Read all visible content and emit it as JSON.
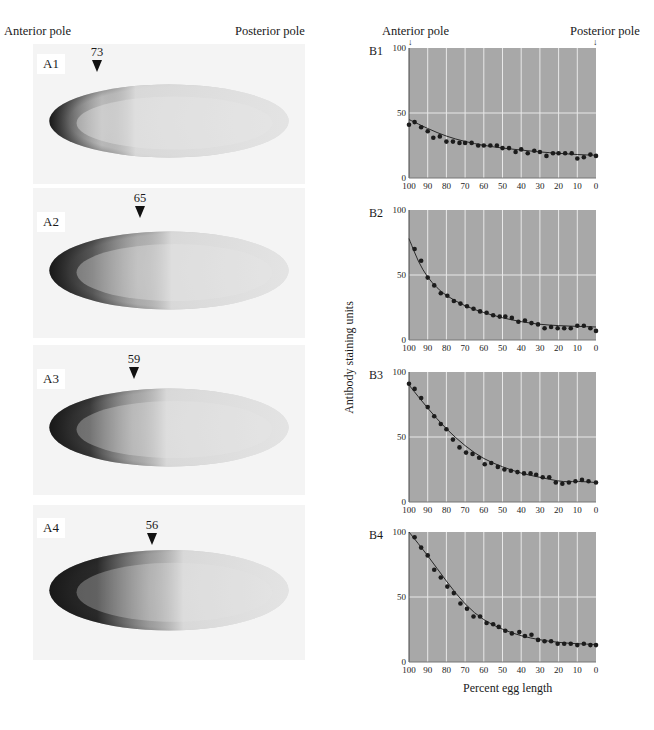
{
  "left_panel": {
    "anterior_label": "Anterior pole",
    "posterior_label": "Posterior pole",
    "photos": [
      {
        "tag": "A1",
        "marker": "73",
        "marker_x": 97,
        "top": 44,
        "height": 140,
        "stain": 0.55
      },
      {
        "tag": "A2",
        "marker": "65",
        "marker_x": 140,
        "top": 188,
        "height": 150,
        "stain": 0.75
      },
      {
        "tag": "A3",
        "marker": "59",
        "marker_x": 134,
        "top": 345,
        "height": 150,
        "stain": 0.9
      },
      {
        "tag": "A4",
        "marker": "56",
        "marker_x": 152,
        "top": 505,
        "height": 155,
        "stain": 1.0
      }
    ]
  },
  "right_panel": {
    "anterior_label": "Anterior pole",
    "posterior_label": "Posterior pole",
    "ylabel": "Antibody staining units",
    "xlabel": "Percent egg length"
  },
  "colors": {
    "plot_bg": "#a8a8a8",
    "grid": "#e8e8e8",
    "points": "#1c1c1c",
    "curve": "#2a2a2a"
  },
  "chart_data": [
    {
      "type": "scatter",
      "title": "B1",
      "xlabel": "Percent egg length",
      "ylabel": "Antibody staining units",
      "xlim": [
        100,
        0
      ],
      "ylim": [
        0,
        100
      ],
      "xticks": [
        100,
        90,
        80,
        70,
        60,
        50,
        40,
        30,
        20,
        10,
        0
      ],
      "yticks": [
        0,
        50,
        100
      ],
      "grid": true,
      "x": [
        100,
        97,
        93.5,
        90,
        87,
        83.5,
        80,
        76.5,
        73,
        70,
        66.5,
        63,
        60,
        56.5,
        53,
        50,
        46.5,
        43,
        40,
        36.5,
        33,
        30,
        26.5,
        23,
        20,
        16.5,
        13,
        10,
        6.5,
        3,
        0
      ],
      "values": [
        41,
        43,
        39,
        36,
        31,
        32,
        28,
        28,
        27,
        27,
        27,
        25,
        25,
        25,
        25,
        23,
        23,
        20,
        22,
        19,
        21,
        20,
        17,
        19,
        19,
        19,
        19,
        15,
        16,
        18,
        17
      ],
      "fit": [
        [
          100,
          45
        ],
        [
          90,
          38
        ],
        [
          80,
          32
        ],
        [
          70,
          28
        ],
        [
          60,
          25
        ],
        [
          50,
          23
        ],
        [
          40,
          21.5
        ],
        [
          30,
          20
        ],
        [
          20,
          19
        ],
        [
          10,
          18
        ],
        [
          0,
          17.5
        ]
      ]
    },
    {
      "type": "scatter",
      "title": "B2",
      "xlabel": "Percent egg length",
      "ylabel": "Antibody staining units",
      "xlim": [
        100,
        0
      ],
      "ylim": [
        0,
        100
      ],
      "xticks": [
        100,
        90,
        80,
        70,
        60,
        50,
        40,
        30,
        20,
        10,
        0
      ],
      "yticks": [
        0,
        50,
        100
      ],
      "grid": true,
      "x": [
        97,
        93.5,
        90,
        86.5,
        83,
        79.5,
        76,
        72.5,
        69,
        65.5,
        62,
        58.5,
        55,
        51.5,
        48.5,
        45,
        41.5,
        38,
        34.5,
        31,
        27.5,
        24,
        20.5,
        17,
        13.5,
        10,
        6.5,
        3,
        0
      ],
      "values": [
        70,
        61,
        48,
        42,
        36,
        34,
        30,
        28,
        26,
        24,
        22,
        21,
        19,
        18,
        18,
        17,
        14,
        15,
        13,
        12,
        9,
        10,
        9,
        9,
        9,
        11,
        11,
        9,
        7
      ],
      "fit": [
        [
          100,
          78
        ],
        [
          95,
          60
        ],
        [
          90,
          48
        ],
        [
          85,
          40
        ],
        [
          80,
          34
        ],
        [
          70,
          26
        ],
        [
          60,
          21
        ],
        [
          50,
          17
        ],
        [
          40,
          14
        ],
        [
          30,
          12
        ],
        [
          20,
          11
        ],
        [
          10,
          10.5
        ],
        [
          0,
          10
        ]
      ]
    },
    {
      "type": "scatter",
      "title": "B3",
      "xlabel": "Percent egg length",
      "ylabel": "Antibody staining units",
      "xlim": [
        100,
        0
      ],
      "ylim": [
        0,
        100
      ],
      "xticks": [
        100,
        90,
        80,
        70,
        60,
        50,
        40,
        30,
        20,
        10,
        0
      ],
      "yticks": [
        0,
        50,
        100
      ],
      "grid": true,
      "x": [
        100,
        97,
        93.5,
        90,
        86.5,
        83,
        80,
        76.5,
        73,
        69.5,
        66,
        62.5,
        59.5,
        56,
        52.5,
        49,
        45.5,
        42,
        38.5,
        35,
        32,
        28.5,
        25,
        21.5,
        18,
        14.5,
        11,
        7.5,
        4,
        0
      ],
      "values": [
        91,
        87,
        80,
        73,
        66,
        60,
        56,
        48,
        42,
        38,
        37,
        34,
        29,
        30,
        27,
        25,
        24,
        23,
        22,
        22,
        21,
        19,
        19,
        15,
        14,
        15,
        16,
        17,
        16,
        15
      ],
      "fit": [
        [
          100,
          90
        ],
        [
          90,
          72
        ],
        [
          80,
          56
        ],
        [
          70,
          43
        ],
        [
          60,
          33
        ],
        [
          50,
          27
        ],
        [
          40,
          22
        ],
        [
          30,
          19
        ],
        [
          20,
          16
        ],
        [
          15,
          15.5
        ],
        [
          10,
          16
        ],
        [
          0,
          15
        ]
      ]
    },
    {
      "type": "scatter",
      "title": "B4",
      "xlabel": "Percent egg length",
      "ylabel": "Antibody staining units",
      "xlim": [
        100,
        0
      ],
      "ylim": [
        0,
        100
      ],
      "xticks": [
        100,
        90,
        80,
        70,
        60,
        50,
        40,
        30,
        20,
        10,
        0
      ],
      "yticks": [
        0,
        50,
        100
      ],
      "grid": true,
      "x": [
        97,
        93.5,
        90,
        86.5,
        83,
        79.5,
        76,
        72.5,
        69,
        65.5,
        62,
        58.5,
        55,
        52,
        48.5,
        45,
        41,
        38,
        34.5,
        31,
        27.5,
        24,
        20.5,
        17,
        13.5,
        10,
        6.5,
        3,
        0
      ],
      "values": [
        96,
        88,
        82,
        71,
        65,
        58,
        53,
        45,
        41,
        35,
        35,
        30,
        29,
        27,
        24,
        22,
        23,
        20,
        21,
        17,
        16,
        16,
        14,
        14,
        14,
        13,
        14,
        13,
        13
      ],
      "fit": [
        [
          100,
          100
        ],
        [
          90,
          82
        ],
        [
          80,
          62
        ],
        [
          70,
          44
        ],
        [
          60,
          32
        ],
        [
          50,
          25
        ],
        [
          40,
          20
        ],
        [
          30,
          17
        ],
        [
          20,
          15
        ],
        [
          10,
          14
        ],
        [
          0,
          13.5
        ]
      ]
    }
  ]
}
